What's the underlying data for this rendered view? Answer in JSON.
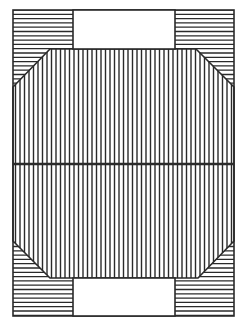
{
  "diagram": {
    "width": 243,
    "height": 330,
    "background": "#ffffff",
    "stroke_color": "#2a2a2a",
    "outer_rect": {
      "x": 13,
      "y": 10,
      "w": 221,
      "h": 306
    },
    "top_notch": {
      "x1": 73,
      "x2": 175,
      "y1": 10,
      "y2": 49
    },
    "bottom_notch": {
      "x1": 73,
      "x2": 175,
      "y1": 278,
      "y2": 316
    },
    "central_region": {
      "polygon": [
        [
          50,
          49
        ],
        [
          196,
          49
        ],
        [
          234,
          87
        ],
        [
          234,
          241
        ],
        [
          198,
          278
        ],
        [
          50,
          278
        ],
        [
          13,
          241
        ],
        [
          13,
          87
        ]
      ],
      "hatch": "vertical",
      "hatch_spacing": 4.5
    },
    "corner_blocks": [
      {
        "name": "top-left",
        "x1": 13,
        "x2": 73,
        "y1": 10,
        "y2": 49,
        "hatch": "horizontal"
      },
      {
        "name": "top-right",
        "x1": 175,
        "x2": 234,
        "y1": 10,
        "y2": 49,
        "hatch": "horizontal"
      },
      {
        "name": "bottom-left",
        "x1": 13,
        "x2": 73,
        "y1": 278,
        "y2": 316,
        "hatch": "horizontal"
      },
      {
        "name": "bottom-right",
        "x1": 175,
        "x2": 234,
        "y1": 278,
        "y2": 316,
        "hatch": "horizontal"
      }
    ],
    "corner_triangles": [
      {
        "name": "top-left",
        "points": [
          [
            13,
            49
          ],
          [
            50,
            49
          ],
          [
            13,
            87
          ]
        ],
        "hatch": "horizontal"
      },
      {
        "name": "top-right",
        "points": [
          [
            196,
            49
          ],
          [
            234,
            49
          ],
          [
            234,
            87
          ]
        ],
        "hatch": "horizontal"
      },
      {
        "name": "bottom-left",
        "points": [
          [
            13,
            241
          ],
          [
            50,
            278
          ],
          [
            13,
            278
          ]
        ],
        "hatch": "horizontal"
      },
      {
        "name": "bottom-right",
        "points": [
          [
            234,
            241
          ],
          [
            234,
            278
          ],
          [
            198,
            278
          ]
        ],
        "hatch": "horizontal"
      }
    ],
    "horizontal_hatch_spacing": 4.3,
    "center_divider_y": 164
  }
}
